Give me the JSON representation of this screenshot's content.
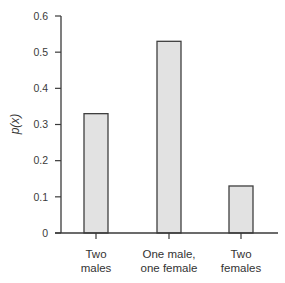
{
  "chart_data": {
    "type": "bar",
    "title": "",
    "xlabel": "",
    "ylabel": "p(x)",
    "ylim": [
      0,
      0.6
    ],
    "yticks": [
      0,
      0.1,
      0.2,
      0.3,
      0.4,
      0.5,
      0.6
    ],
    "ytick_labels": [
      "0",
      "0.1",
      "0.2",
      "0.3",
      "0.4",
      "0.5",
      "0.6"
    ],
    "categories": [
      [
        "Two",
        "males"
      ],
      [
        "One male,",
        "one female"
      ],
      [
        "Two",
        "females"
      ]
    ],
    "values": [
      0.33,
      0.53,
      0.13
    ],
    "grid": false,
    "legend": "none",
    "colors": {
      "bar_fill": "#e2e2e2",
      "bar_edge": "#3f3f3f",
      "axis": "#3a3a3a"
    }
  }
}
